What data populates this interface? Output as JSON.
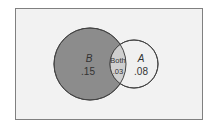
{
  "diagram": {
    "type": "venn",
    "sets": [
      {
        "name": "B",
        "value": ".15",
        "fill": "#8c8c8c"
      },
      {
        "name": "A",
        "value": ".08",
        "fill": "#f0f0f0"
      }
    ],
    "intersection": {
      "label": "Both",
      "value": ".03",
      "fill": "#cfcfcf"
    },
    "frame_fill": "#f2f2f2",
    "frame_stroke": "#808080"
  }
}
